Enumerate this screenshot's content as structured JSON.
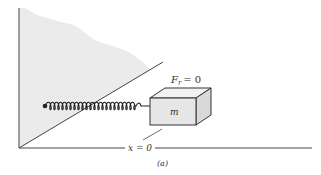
{
  "figure": {
    "force_label": "F_r = 0",
    "force_symbol": "F",
    "force_subscript": "r",
    "force_rhs": "= 0",
    "mass_label": "m",
    "position_label": "x = 0",
    "caption": "(a)"
  },
  "colors": {
    "wall_shade": "#ebebeb",
    "line": "#444444",
    "block_fill": "#e6e6e6",
    "block_top": "#f2f2f2",
    "block_side": "#d9d9d9"
  }
}
